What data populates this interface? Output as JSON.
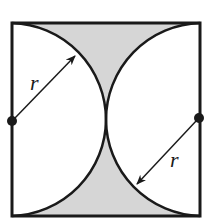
{
  "diagram": {
    "colors": {
      "stroke": "#1a1a1a",
      "shade": "#d6d6d6",
      "background": "#ffffff"
    },
    "square": {
      "x": 12,
      "y": 23,
      "size": 188
    },
    "arcs": [
      {
        "name": "left-arc",
        "center": [
          12,
          120
        ],
        "radius": 94
      },
      {
        "name": "right-arc",
        "center": [
          200,
          120
        ],
        "radius": 94
      }
    ],
    "points": [
      {
        "name": "left-center-dot",
        "x": 12,
        "y": 121
      },
      {
        "name": "right-center-dot",
        "x": 199,
        "y": 118
      }
    ],
    "labels": [
      {
        "name": "left-radius-label",
        "text": "r",
        "x": 32,
        "y": 88
      },
      {
        "name": "right-radius-label",
        "text": "r",
        "x": 170,
        "y": 166
      }
    ],
    "shaded_regions": [
      "top-between-arcs",
      "bottom-between-arcs"
    ]
  }
}
